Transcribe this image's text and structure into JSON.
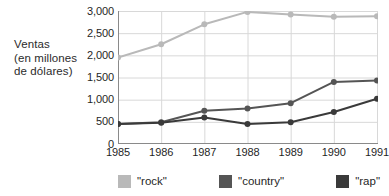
{
  "chart_data": {
    "type": "line",
    "title": "",
    "subtitle": "",
    "xlabel": "",
    "ylabel": "Ventas (en millones de dólares)",
    "ylabel_lines": [
      "Ventas",
      "(en millones",
      "de dólares)"
    ],
    "categories": [
      "1985",
      "1986",
      "1987",
      "1988",
      "1989",
      "1990",
      "1991"
    ],
    "x": [
      1985,
      1986,
      1987,
      1988,
      1989,
      1990,
      1991
    ],
    "ylim": [
      0,
      3000
    ],
    "xlim": [
      1985,
      1991
    ],
    "y_ticks": [
      0,
      500,
      1000,
      1500,
      2000,
      2500,
      3000
    ],
    "y_tick_labels": [
      "0",
      "500",
      "1,000",
      "1,500",
      "2,000",
      "2,500",
      "3,000"
    ],
    "grid": true,
    "grid_axis": "both",
    "legend_position": "bottom",
    "markers": "circle",
    "series": [
      {
        "name": "\"rock\"",
        "color": "#b9b9b9",
        "values": [
          1950,
          2250,
          2700,
          2980,
          2920,
          2870,
          2880
        ]
      },
      {
        "name": "\"country\"",
        "color": "#555555",
        "values": [
          450,
          490,
          750,
          800,
          920,
          1400,
          1430
        ]
      },
      {
        "name": "\"rap\"",
        "color": "#3a3a3a",
        "values": [
          450,
          480,
          600,
          450,
          490,
          720,
          1020
        ]
      }
    ]
  },
  "legend": {
    "items": [
      {
        "label": "\"rock\"",
        "color": "#b9b9b9"
      },
      {
        "label": "\"country\"",
        "color": "#555555"
      },
      {
        "label": "\"rap\"",
        "color": "#3a3a3a"
      }
    ]
  },
  "axis_style": {
    "axis_color": "#8a8a8a",
    "grid_color": "#d8d8d8",
    "text_color": "#1f1f1f"
  }
}
